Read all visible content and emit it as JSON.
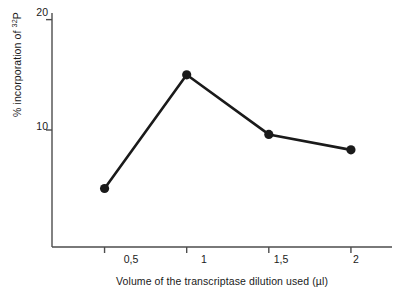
{
  "chart_data": {
    "type": "line",
    "title": "",
    "xlabel": "Volume of the transcriptase dilution used (µl)",
    "ylabel_prefix": "% incorporation of ",
    "ylabel_sup": "32",
    "ylabel_suffix": "P",
    "x": [
      0.5,
      1,
      1.5,
      2
    ],
    "values": [
      4.7,
      15.0,
      9.6,
      8.2
    ],
    "categories": [
      "0,5",
      "1",
      "1,5",
      "2"
    ],
    "xtick_labels": [
      "0,5",
      "1",
      "1,5",
      "2"
    ],
    "ytick_labels": [
      "10",
      "20"
    ],
    "ytick_values": [
      10,
      20
    ],
    "xlim": [
      0.18,
      2.25
    ],
    "ylim": [
      -0.6,
      20.6
    ],
    "grid": false,
    "legend": null,
    "marker": "filled-circle",
    "line_color": "#1a1a1a",
    "marker_color": "#1a1a1a",
    "background_color": "#ffffff",
    "axis_color": "#4d4d4d",
    "series": [
      {
        "name": "% incorporation of 32P",
        "points": [
          {
            "x": "0,5",
            "y": 4.7
          },
          {
            "x": "1",
            "y": 15.0
          },
          {
            "x": "1,5",
            "y": 9.6
          },
          {
            "x": "2",
            "y": 8.2
          }
        ]
      }
    ]
  }
}
